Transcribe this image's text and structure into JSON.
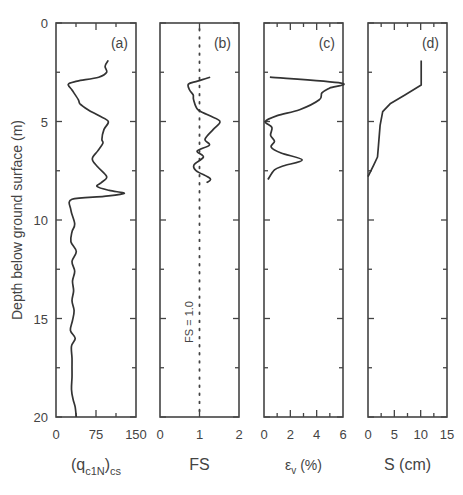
{
  "figure": {
    "ylabel": "Depth below ground surface  (m)",
    "ytick_labels": [
      "0",
      "5",
      "10",
      "15",
      "20"
    ],
    "line_color": "#333333"
  },
  "chart_data": [
    {
      "type": "line",
      "panel": "(a)",
      "xlabel_main": "(q",
      "xlabel_sub1": "c1N",
      "xlabel_close": ")",
      "xlabel_sub2": "cs",
      "xlabel": "(qc1N)cs",
      "ylabel": "Depth below ground surface (m)",
      "xlim": [
        0,
        150
      ],
      "ylim": [
        20,
        0
      ],
      "xticks": [
        "0",
        "75",
        "150"
      ],
      "series": [
        {
          "name": "(qc1N)cs",
          "points": [
            [
              98,
              1.9
            ],
            [
              92,
              2.2
            ],
            [
              95,
              2.5
            ],
            [
              80,
              2.75
            ],
            [
              40,
              2.95
            ],
            [
              23,
              3.1
            ],
            [
              30,
              3.4
            ],
            [
              42,
              3.9
            ],
            [
              45,
              4.1
            ],
            [
              60,
              4.4
            ],
            [
              80,
              4.7
            ],
            [
              98,
              5.0
            ],
            [
              90,
              5.4
            ],
            [
              86,
              5.9
            ],
            [
              88,
              6.1
            ],
            [
              78,
              6.5
            ],
            [
              68,
              6.9
            ],
            [
              78,
              7.3
            ],
            [
              95,
              7.8
            ],
            [
              85,
              8.1
            ],
            [
              77,
              8.3
            ],
            [
              100,
              8.5
            ],
            [
              128,
              8.65
            ],
            [
              90,
              8.8
            ],
            [
              30,
              8.95
            ],
            [
              28,
              9.5
            ],
            [
              35,
              10.2
            ],
            [
              30,
              10.6
            ],
            [
              28,
              11.1
            ],
            [
              38,
              11.6
            ],
            [
              30,
              12.1
            ],
            [
              35,
              12.6
            ],
            [
              31,
              13.1
            ],
            [
              33,
              13.6
            ],
            [
              30,
              14.1
            ],
            [
              34,
              14.6
            ],
            [
              31,
              15.1
            ],
            [
              27,
              15.6
            ],
            [
              36,
              16.0
            ],
            [
              29,
              16.4
            ],
            [
              30,
              17.0
            ],
            [
              30,
              17.5
            ],
            [
              30,
              18.0
            ],
            [
              29,
              18.6
            ],
            [
              32,
              19.1
            ],
            [
              36,
              19.5
            ],
            [
              38,
              20.0
            ]
          ]
        }
      ]
    },
    {
      "type": "line",
      "panel": "(b)",
      "xlabel": "FS",
      "xlim": [
        0,
        2
      ],
      "ylim": [
        20,
        0
      ],
      "xticks": [
        "0",
        "1",
        "2"
      ],
      "annotation": "FS = 1.0",
      "reference_line": {
        "x": 1.0,
        "style": "dotted"
      },
      "series": [
        {
          "name": "FS",
          "points": [
            [
              1.27,
              2.75
            ],
            [
              0.95,
              2.95
            ],
            [
              0.72,
              3.1
            ],
            [
              0.75,
              3.4
            ],
            [
              0.84,
              3.65
            ],
            [
              0.85,
              3.9
            ],
            [
              0.96,
              4.4
            ],
            [
              1.25,
              4.7
            ],
            [
              1.52,
              5.0
            ],
            [
              1.35,
              5.4
            ],
            [
              1.14,
              5.9
            ],
            [
              1.25,
              6.2
            ],
            [
              0.94,
              6.5
            ],
            [
              1.1,
              6.8
            ],
            [
              0.86,
              7.2
            ],
            [
              0.92,
              7.5
            ],
            [
              1.27,
              7.9
            ],
            [
              1.18,
              8.1
            ]
          ]
        }
      ]
    },
    {
      "type": "line",
      "panel": "(c)",
      "xlabel": "εv (%)",
      "xlabel_main": "ε",
      "xlabel_sub": "v",
      "xlabel_tail": " (%)",
      "xlim": [
        0,
        6
      ],
      "ylim": [
        20,
        0
      ],
      "xticks": [
        "0",
        "2",
        "4",
        "6"
      ],
      "series": [
        {
          "name": "εv",
          "points": [
            [
              0.45,
              2.75
            ],
            [
              5.85,
              3.05
            ],
            [
              5.0,
              3.3
            ],
            [
              4.4,
              3.55
            ],
            [
              4.2,
              3.9
            ],
            [
              2.7,
              4.4
            ],
            [
              1.0,
              4.7
            ],
            [
              0.1,
              5.0
            ],
            [
              0.6,
              5.3
            ],
            [
              0.5,
              5.7
            ],
            [
              0.8,
              6.0
            ],
            [
              0.55,
              6.3
            ],
            [
              1.3,
              6.6
            ],
            [
              2.9,
              6.95
            ],
            [
              1.5,
              7.25
            ],
            [
              0.8,
              7.45
            ],
            [
              0.3,
              7.95
            ]
          ]
        }
      ]
    },
    {
      "type": "line",
      "panel": "(d)",
      "xlabel": "S (cm)",
      "xlim": [
        0,
        15
      ],
      "ylim": [
        20,
        0
      ],
      "xticks": [
        "0",
        "5",
        "10",
        "15"
      ],
      "series": [
        {
          "name": "S",
          "points": [
            [
              10.1,
              1.9
            ],
            [
              10.1,
              3.15
            ],
            [
              7.0,
              3.65
            ],
            [
              4.2,
              4.1
            ],
            [
              2.8,
              4.5
            ],
            [
              2.3,
              5.2
            ],
            [
              2.0,
              6.2
            ],
            [
              1.8,
              6.8
            ],
            [
              1.1,
              7.2
            ],
            [
              0.0,
              7.8
            ]
          ]
        }
      ]
    }
  ]
}
